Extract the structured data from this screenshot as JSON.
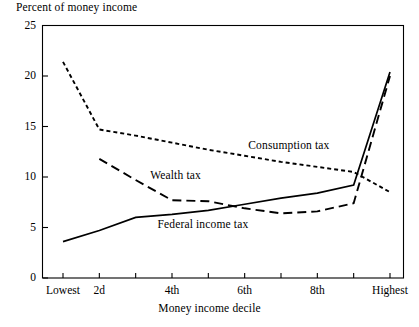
{
  "chart_data": {
    "type": "line",
    "title": "",
    "ylabel": "Percent of money income",
    "xlabel": "Money income decile",
    "ylim": [
      0,
      25
    ],
    "yticks": [
      0,
      5,
      10,
      15,
      20,
      25
    ],
    "ytick_labels": [
      "0",
      "5",
      "10",
      "15",
      "20",
      "25"
    ],
    "grid": false,
    "legend_position": "inline-annotations",
    "categories": [
      "Lowest",
      "2d",
      "3d",
      "4th",
      "5th",
      "6th",
      "7th",
      "8th",
      "9th",
      "Highest"
    ],
    "xtick_labels_shown": [
      "Lowest",
      "2d",
      "4th",
      "6th",
      "8th",
      "Highest"
    ],
    "xtick_label_indices": [
      0,
      1,
      3,
      5,
      7,
      9
    ],
    "series": [
      {
        "name": "Consumption tax",
        "style": "short-dashed",
        "color": "#000000",
        "values": [
          21.4,
          14.7,
          14.1,
          13.4,
          12.7,
          12.1,
          11.5,
          11.0,
          10.5,
          8.5
        ],
        "label_x_index": 5.1,
        "label_y": 13.1
      },
      {
        "name": "Wealth tax",
        "style": "long-dashed",
        "color": "#000000",
        "values": [
          null,
          11.8,
          9.7,
          7.7,
          7.6,
          6.9,
          6.4,
          6.6,
          7.4,
          20.0
        ],
        "label_x_index": 2.4,
        "label_y": 10.1
      },
      {
        "name": "Federal income tax",
        "style": "solid",
        "color": "#000000",
        "values": [
          3.6,
          4.7,
          6.0,
          6.3,
          6.7,
          7.3,
          7.9,
          8.4,
          9.2,
          20.4
        ],
        "label_x_index": 2.6,
        "label_y": 5.2
      }
    ]
  },
  "axes": {
    "frame_color": "#000000"
  }
}
